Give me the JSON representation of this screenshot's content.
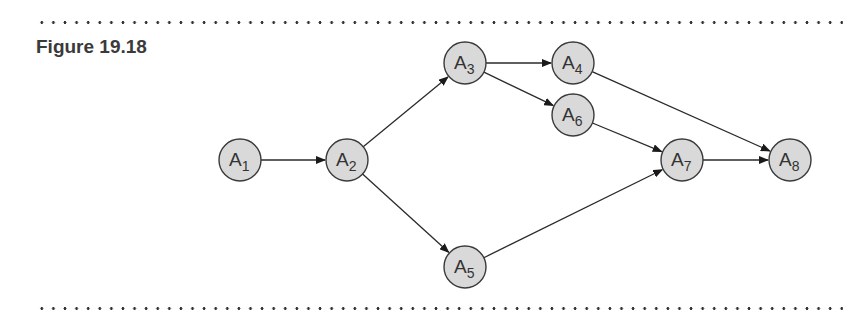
{
  "figure": {
    "title": "Figure 19.18"
  },
  "graph": {
    "nodes": [
      {
        "id": "A1",
        "label": "A",
        "sub": "1",
        "x": 240,
        "y": 160
      },
      {
        "id": "A2",
        "label": "A",
        "sub": "2",
        "x": 347,
        "y": 160
      },
      {
        "id": "A3",
        "label": "A",
        "sub": "3",
        "x": 465,
        "y": 63
      },
      {
        "id": "A4",
        "label": "A",
        "sub": "4",
        "x": 573,
        "y": 63
      },
      {
        "id": "A5",
        "label": "A",
        "sub": "5",
        "x": 465,
        "y": 267
      },
      {
        "id": "A6",
        "label": "A",
        "sub": "6",
        "x": 573,
        "y": 115
      },
      {
        "id": "A7",
        "label": "A",
        "sub": "7",
        "x": 682,
        "y": 160
      },
      {
        "id": "A8",
        "label": "A",
        "sub": "8",
        "x": 790,
        "y": 160
      }
    ],
    "edges": [
      {
        "from": "A1",
        "to": "A2"
      },
      {
        "from": "A2",
        "to": "A3"
      },
      {
        "from": "A2",
        "to": "A5"
      },
      {
        "from": "A3",
        "to": "A4"
      },
      {
        "from": "A3",
        "to": "A6"
      },
      {
        "from": "A4",
        "to": "A8"
      },
      {
        "from": "A6",
        "to": "A7"
      },
      {
        "from": "A5",
        "to": "A7"
      },
      {
        "from": "A7",
        "to": "A8"
      }
    ],
    "node_radius": 21,
    "node_fill": "#d9d9d9",
    "stroke": "#3a3a3a"
  }
}
